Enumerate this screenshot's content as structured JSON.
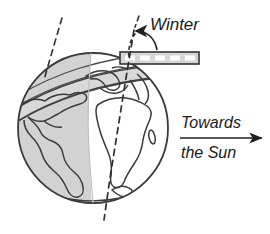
{
  "figure": {
    "background_color": "#ffffff",
    "labels": {
      "season": "Winter",
      "direction_line1": "Towards",
      "direction_line2": "the Sun"
    },
    "colors": {
      "outline": "#3a3a3a",
      "night_shade": "#d0d0d0",
      "band_fill": "#d6d6d6",
      "dash_fill": "#ffffff",
      "text": "#1a1a1a"
    },
    "elements": {
      "globe_name": "earth-globe",
      "night_side_name": "night-shaded-hemisphere",
      "terminator_name": "day-night-terminator",
      "axis_name": "rotation-axis-dashed-line",
      "normal_name": "orbital-plane-normal-dashed-line",
      "orbital_band_name": "orbital-plane-band",
      "equator_band_name": "tilted-equatorial-band",
      "angle_arc_name": "tilt-angle-arc",
      "sun_arrow_name": "towards-sun-arrow"
    },
    "geometry": {
      "globe_center_x": 93,
      "globe_center_y": 128,
      "globe_radius": 75,
      "band_left": 120,
      "band_right": 199,
      "band_top": 52,
      "band_bottom": 64,
      "arrow_start_x": 180,
      "arrow_end_x": 262,
      "arrow_y": 138
    }
  }
}
